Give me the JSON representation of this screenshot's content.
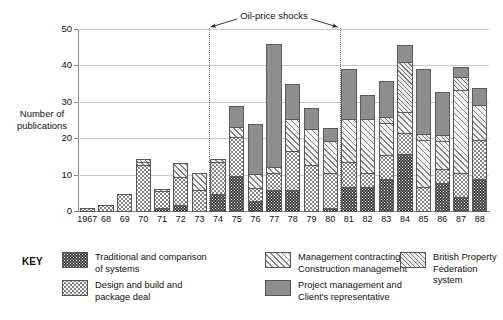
{
  "chart_data": {
    "type": "bar",
    "subtype": "stacked-bar",
    "title": "",
    "xlabel": "",
    "ylabel": "Number of\npublications",
    "ylim": [
      0,
      50
    ],
    "yticks": [
      0,
      10,
      20,
      30,
      40,
      50
    ],
    "grid": true,
    "legend_position": "bottom",
    "categories": [
      "1967",
      "68",
      "69",
      "70",
      "71",
      "72",
      "73",
      "74",
      "75",
      "76",
      "77",
      "78",
      "79",
      "80",
      "81",
      "82",
      "83",
      "84",
      "85",
      "86",
      "87",
      "88"
    ],
    "series": [
      {
        "name": "Traditional and comparison of systems",
        "key": "traditional",
        "values": [
          0,
          0,
          0,
          0,
          1,
          2,
          0,
          5,
          10,
          3,
          6,
          6,
          0,
          1,
          7,
          7,
          9,
          16,
          0,
          8,
          4,
          9
        ]
      },
      {
        "name": "Design and build and package deal",
        "key": "design",
        "values": [
          1,
          2,
          5,
          13,
          6,
          10,
          6,
          14,
          21,
          7,
          11,
          17,
          13,
          11,
          14,
          11,
          16,
          22,
          7,
          12,
          11,
          20
        ]
      },
      {
        "name": "Management contracting and Construction management",
        "key": "management",
        "values": [
          1,
          2,
          5,
          14,
          7,
          14,
          11,
          15,
          24,
          11,
          13,
          26,
          23,
          20,
          26,
          26,
          25,
          28,
          20,
          20,
          34,
          30
        ]
      },
      {
        "name": "British Property Federation system",
        "key": "bpf",
        "values": [
          1,
          2,
          5,
          15,
          7,
          14,
          11,
          15,
          24,
          11,
          13,
          26,
          23,
          20,
          26,
          26,
          27,
          42,
          22,
          22,
          38,
          30
        ]
      },
      {
        "name": "Project management and Client's representative",
        "key": "project",
        "values": [
          1,
          2,
          5,
          15,
          7,
          14,
          11,
          15,
          30,
          25,
          47,
          36,
          29,
          24,
          40,
          33,
          37,
          47,
          40,
          34,
          41,
          35
        ]
      }
    ],
    "stack_totals": [
      1,
      2,
      5,
      15,
      7,
      14,
      11,
      15,
      30,
      25,
      47,
      36,
      29,
      24,
      40,
      33,
      37,
      47,
      40,
      34,
      41,
      35
    ],
    "annotation": {
      "text": "Oil-price shocks",
      "from_category": "73",
      "to_category": "80",
      "style": "double-headed-arrow-between-dotted-lines"
    }
  },
  "key": {
    "title": "KEY",
    "items": [
      {
        "label": "Traditional and comparison\nof systems",
        "pattern": "dark-checker",
        "color": "#3a3a3a"
      },
      {
        "label": "Design and build and\npackage deal",
        "pattern": "fine-dots",
        "color": "#ffffff"
      },
      {
        "label": "Management contracting and\nConstruction management",
        "pattern": "wide-hatch",
        "color": "#f2f2f2"
      },
      {
        "label": "Project management and\nClient's representative",
        "pattern": "solid-gray",
        "color": "#8e8e8e"
      },
      {
        "label": "British Property Federation\nsystem",
        "pattern": "narrow-hatch",
        "color": "#ececec"
      }
    ]
  }
}
